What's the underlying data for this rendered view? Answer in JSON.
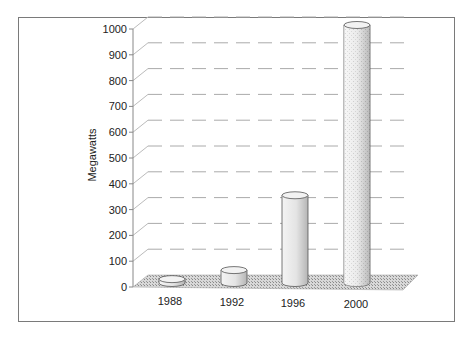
{
  "chart_data": {
    "type": "bar",
    "style": "3d-cylinder",
    "title": "",
    "xlabel": "",
    "ylabel": "Megawatts",
    "categories": [
      "1988",
      "1992",
      "1996",
      "2000"
    ],
    "values": [
      15,
      50,
      340,
      1000
    ],
    "ylim": [
      0,
      1000
    ],
    "yticks": [
      0,
      100,
      200,
      300,
      400,
      500,
      600,
      700,
      800,
      900,
      1000
    ],
    "grid": true,
    "legend": "none"
  },
  "colors": {
    "frame": "#7a7a7a",
    "grid": "#9a9a9a",
    "floor": "#b8b8b8",
    "bar_fill": "#e6e6e6",
    "bar_stroke": "#555555"
  }
}
